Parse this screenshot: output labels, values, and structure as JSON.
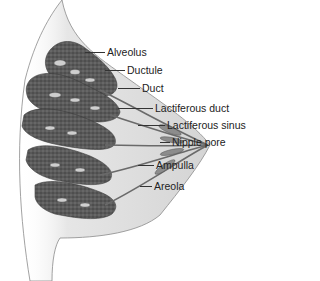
{
  "diagram": {
    "colors": {
      "skin_fill": "#d9d9d9",
      "skin_edge": "#8a8a8a",
      "lobule_fill": "#5a5a5a",
      "lobule_dark": "#3a3a3a",
      "duct_fill": "#8c8c8c",
      "label_text": "#222222",
      "leader_line": "#333333"
    },
    "labels": [
      {
        "id": "alveolus",
        "text": "Alveolus"
      },
      {
        "id": "ductule",
        "text": "Ductule"
      },
      {
        "id": "duct",
        "text": "Duct"
      },
      {
        "id": "lactiferous-duct",
        "text": "Lactiferous duct"
      },
      {
        "id": "lactiferous-sinus",
        "text": "Lactiferous sinus"
      },
      {
        "id": "nipple-pore",
        "text": "Nipple pore"
      },
      {
        "id": "ampulla",
        "text": "Ampulla"
      },
      {
        "id": "areola",
        "text": "Areola"
      }
    ]
  }
}
